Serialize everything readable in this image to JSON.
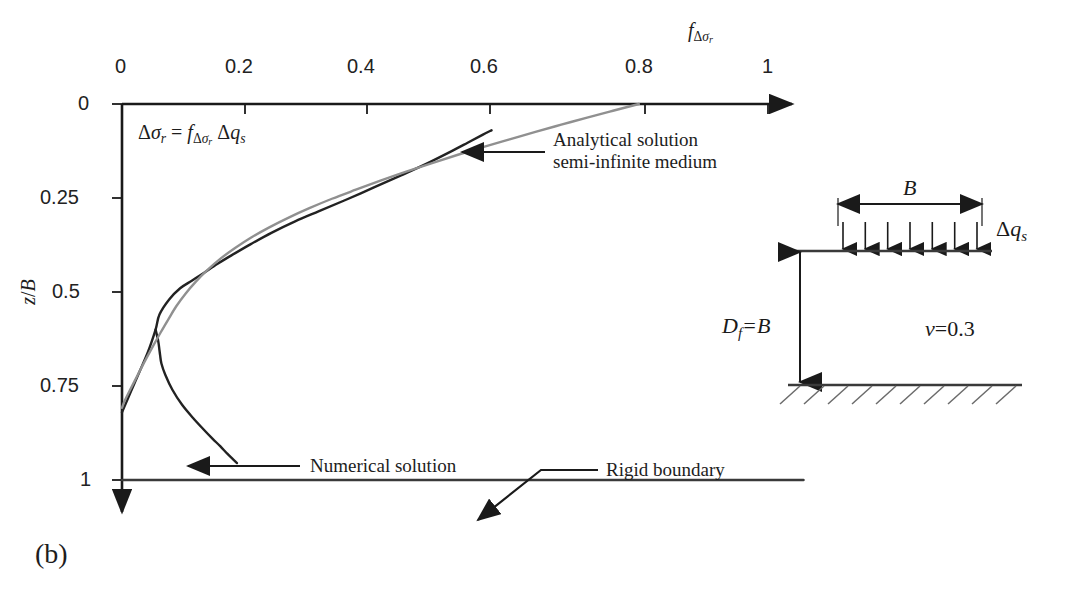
{
  "figure": {
    "panel_label": "(b)",
    "equation": {
      "lhs_delta": "Δ",
      "lhs_sigma": "σ",
      "lhs_sub": "r",
      "eq": "=",
      "f": "f",
      "f_sub_delta": "Δ",
      "f_sub_sigma": "σ",
      "f_sub_sub": "r",
      "rhs_delta": "Δ",
      "rhs_q": "q",
      "rhs_sub": "s",
      "plain": "Δσr = fΔσr Δqs"
    }
  },
  "axes": {
    "x": {
      "title_main": "f",
      "title_sub_delta": "Δ",
      "title_sub_sigma": "σ",
      "title_sub_r": "r",
      "title_plain": "fΔσr",
      "position": "top",
      "ticks": [
        "0",
        "0.2",
        "0.4",
        "0.6",
        "0.8",
        "1"
      ],
      "tick_values": [
        0,
        0.2,
        0.4,
        0.6,
        0.8,
        1
      ],
      "min": 0,
      "max": 1.06
    },
    "y": {
      "title_z": "z",
      "title_slash": "/",
      "title_B": "B",
      "title_plain": "z/B",
      "position": "left",
      "direction": "downward",
      "ticks": [
        "0",
        "0.25",
        "0.5",
        "0.75",
        "1"
      ],
      "tick_values": [
        0,
        0.25,
        0.5,
        0.75,
        1
      ],
      "min": 0,
      "max": 1.09
    }
  },
  "annotations": {
    "analytical": {
      "line1": "Analytical solution",
      "line2": "semi-infinite medium"
    },
    "numerical": {
      "line1": "Numerical solution"
    },
    "rigid": {
      "line1": "Rigid boundary"
    }
  },
  "inset": {
    "width_label": "B",
    "load_label_delta": "Δ",
    "load_label_q": "q",
    "load_label_sub": "s",
    "load_label_plain": "Δqs",
    "depth_label_D": "D",
    "depth_label_sub": "f",
    "depth_label_eq": "=B",
    "depth_label_plain": "Df=B",
    "poisson_nu": "ν",
    "poisson_eq": "=0.3",
    "poisson_plain": "ν=0.3",
    "arrow_count": 7
  },
  "colors": {
    "axis": "#1a1a1a",
    "numerical_curve": "#222222",
    "analytical_curve": "#909090",
    "rigid_boundary": "#3a3a3a",
    "text": "#1d1d1d",
    "hatch": "#6b6b6b"
  },
  "chart_data": {
    "type": "line",
    "title": "",
    "xlabel": "fΔσr",
    "ylabel": "z/B",
    "xlim": [
      0,
      1.06
    ],
    "ylim": [
      0,
      1.09
    ],
    "y_inverted": true,
    "grid": false,
    "legend": "annotations",
    "series": [
      {
        "name": "Numerical solution",
        "color": "#222222",
        "x": [
          0.0,
          0.02,
          0.04,
          0.052,
          0.058,
          0.073,
          0.09,
          0.108,
          0.126,
          0.148,
          0.17,
          0.2,
          0.232,
          0.268,
          0.305,
          0.345,
          0.39,
          0.432,
          0.47,
          0.505,
          0.535,
          0.558,
          0.572
        ],
        "y": [
          0.82,
          0.74,
          0.66,
          0.6,
          0.56,
          0.52,
          0.49,
          0.47,
          0.45,
          0.425,
          0.402,
          0.372,
          0.342,
          0.312,
          0.285,
          0.256,
          0.222,
          0.19,
          0.16,
          0.13,
          0.103,
          0.082,
          0.07
        ]
      },
      {
        "name": "Numerical solution lower branch",
        "color": "#222222",
        "x": [
          0.052,
          0.056,
          0.058,
          0.059,
          0.061,
          0.067,
          0.078,
          0.093,
          0.11,
          0.126,
          0.14,
          0.152,
          0.163,
          0.172,
          0.178
        ],
        "y": [
          0.6,
          0.63,
          0.655,
          0.668,
          0.69,
          0.72,
          0.76,
          0.8,
          0.835,
          0.865,
          0.89,
          0.91,
          0.93,
          0.945,
          0.955
        ]
      },
      {
        "name": "Analytical solution semi-infinite medium",
        "color": "#909090",
        "x": [
          0.8,
          0.76,
          0.72,
          0.68,
          0.64,
          0.6,
          0.56,
          0.52,
          0.48,
          0.44,
          0.4,
          0.362,
          0.325,
          0.29,
          0.258,
          0.228,
          0.2,
          0.175,
          0.152,
          0.132,
          0.114,
          0.098,
          0.084,
          0.072,
          0.06,
          0.048,
          0.036,
          0.024,
          0.012,
          0.004,
          0.0
        ],
        "y": [
          0.0,
          0.018,
          0.036,
          0.055,
          0.074,
          0.094,
          0.114,
          0.135,
          0.157,
          0.18,
          0.204,
          0.228,
          0.252,
          0.277,
          0.302,
          0.328,
          0.355,
          0.383,
          0.412,
          0.442,
          0.473,
          0.505,
          0.538,
          0.572,
          0.607,
          0.644,
          0.682,
          0.722,
          0.762,
          0.79,
          0.808
        ]
      },
      {
        "name": "Rigid boundary",
        "color": "#3a3a3a",
        "x": [
          0.0,
          1.055
        ],
        "y": [
          1.0,
          1.0
        ]
      }
    ]
  }
}
